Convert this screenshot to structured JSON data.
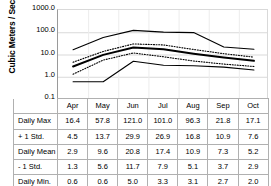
{
  "chart_data": {
    "type": "line",
    "title": "",
    "xlabel": "",
    "ylabel": "Cubic Meters / Second",
    "yscale": "log",
    "ylim": [
      0.1,
      1000.0
    ],
    "ytick_labels": [
      "1000.0",
      "100.0",
      "10.0",
      "1.0",
      "0.1"
    ],
    "ytick_values": [
      1000.0,
      100.0,
      10.0,
      1.0,
      0.1
    ],
    "grid": true,
    "legend": "none",
    "categories": [
      "Apr",
      "May",
      "Jun",
      "Jul",
      "Aug",
      "Sep",
      "Oct"
    ],
    "series": [
      {
        "name": "Daily Max",
        "style": "solid-thin",
        "values": [
          16.4,
          57.8,
          121.0,
          101.0,
          96.3,
          21.8,
          17.1
        ]
      },
      {
        "name": "+ 1 Std.",
        "style": "dotted",
        "values": [
          4.5,
          13.7,
          29.9,
          26.9,
          16.8,
          10.9,
          7.6
        ]
      },
      {
        "name": "Daily Mean",
        "style": "solid-thick",
        "values": [
          2.9,
          9.6,
          20.8,
          17.4,
          10.9,
          7.3,
          5.2
        ]
      },
      {
        "name": "- 1 Std.",
        "style": "dotted",
        "values": [
          1.3,
          5.6,
          11.7,
          7.9,
          5.1,
          3.7,
          2.9
        ]
      },
      {
        "name": "Daily Min.",
        "style": "solid-thin",
        "values": [
          0.6,
          0.6,
          5.0,
          3.3,
          3.1,
          2.7,
          2.0
        ]
      }
    ]
  },
  "table": {
    "corner_label": "",
    "column_headers": [
      "Apr",
      "May",
      "Jun",
      "Jul",
      "Aug",
      "Sep",
      "Oct"
    ],
    "rows": [
      {
        "label": "Daily Max",
        "values": [
          "16.4",
          "57.8",
          "121.0",
          "101.0",
          "96.3",
          "21.8",
          "17.1"
        ]
      },
      {
        "label": "+ 1 Std.",
        "values": [
          "4.5",
          "13.7",
          "29.9",
          "26.9",
          "16.8",
          "10.9",
          "7.6"
        ]
      },
      {
        "label": "Daily Mean",
        "values": [
          "2.9",
          "9.6",
          "20.8",
          "17.4",
          "10.9",
          "7.3",
          "5.2"
        ]
      },
      {
        "label": "- 1 Std.",
        "values": [
          "1.3",
          "5.6",
          "11.7",
          "7.9",
          "5.1",
          "3.7",
          "2.9"
        ]
      },
      {
        "label": "Daily Min.",
        "values": [
          "0.6",
          "0.6",
          "5.0",
          "3.3",
          "3.1",
          "2.7",
          "2.0"
        ]
      }
    ]
  },
  "colors": {
    "line": "#000000",
    "grid": "#d9d9d9",
    "axis": "#9a9a9a",
    "table_border": "#b0b0b0",
    "background": "#ffffff"
  }
}
